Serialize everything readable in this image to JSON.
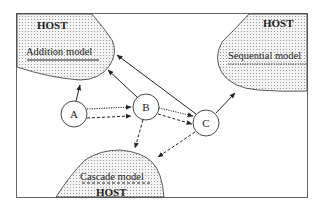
{
  "diagram": {
    "frame_color": "#555555",
    "region_fill": "#e4e4e4",
    "regions": [
      {
        "id": "addition",
        "host_label": "HOST",
        "model_label": "Addition model",
        "underline": "solid"
      },
      {
        "id": "sequential",
        "host_label": "HOST",
        "model_label": "Sequential model",
        "underline": "dotted"
      },
      {
        "id": "cascade",
        "host_label": "HOST",
        "model_label": "Cascade model",
        "underline": "dashed"
      }
    ],
    "nodes": [
      {
        "id": "A",
        "label": "A"
      },
      {
        "id": "B",
        "label": "B"
      },
      {
        "id": "C",
        "label": "C"
      }
    ],
    "edges": [
      {
        "from": "A",
        "to": "Addition model",
        "style": "solid"
      },
      {
        "from": "B",
        "to": "Addition model",
        "style": "solid"
      },
      {
        "from": "C",
        "to": "Addition model",
        "style": "solid"
      },
      {
        "from": "A",
        "to": "B",
        "style": "dotted"
      },
      {
        "from": "A",
        "to": "B",
        "style": "dashed"
      },
      {
        "from": "B",
        "to": "C",
        "style": "dotted"
      },
      {
        "from": "B",
        "to": "C",
        "style": "dashed"
      },
      {
        "from": "C",
        "to": "Sequential model",
        "style": "solid"
      },
      {
        "from": "B",
        "to": "Cascade model",
        "style": "dashed"
      },
      {
        "from": "C",
        "to": "Cascade model",
        "style": "dashed"
      }
    ]
  }
}
